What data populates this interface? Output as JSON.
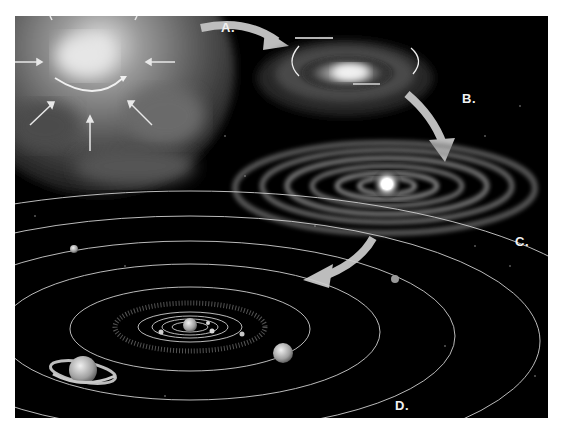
{
  "figure": {
    "panels": [
      {
        "id": "A",
        "label": "A.",
        "subject": "collapsing nebula with inward-pointing arrows and rotation arc"
      },
      {
        "id": "B",
        "label": "B.",
        "subject": "flattened rotating cloud with circular rotation arrows"
      },
      {
        "id": "C",
        "label": "C.",
        "subject": "protoplanetary disk with concentric rings and bright central star"
      },
      {
        "id": "D",
        "label": "D.",
        "subject": "solar system with sun, orbits, asteroid belt and planets including a ringed planet"
      }
    ],
    "colors": {
      "background": "#000000",
      "page": "#ffffff",
      "arrow": "#bfbfbf",
      "label": "#f2f2f2",
      "orbit": "#d9d9d9"
    }
  }
}
